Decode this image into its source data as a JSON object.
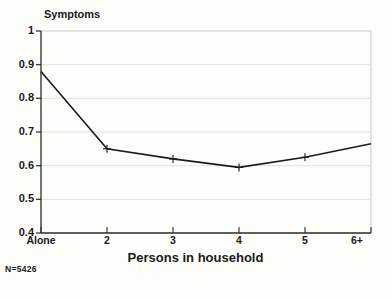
{
  "chart_data": {
    "type": "line",
    "title": "",
    "ylabel": "Symptoms",
    "xlabel": "Persons in household",
    "categories": [
      "Alone",
      "2",
      "3",
      "4",
      "5",
      "6+"
    ],
    "values": [
      0.88,
      0.65,
      0.62,
      0.595,
      0.625,
      0.665
    ],
    "series": [
      {
        "name": "Symptoms",
        "values": [
          0.88,
          0.65,
          0.62,
          0.595,
          0.625,
          0.665
        ]
      }
    ],
    "ylim": [
      0.4,
      1
    ],
    "ytick_labels": [
      "1",
      "0.9",
      "0.8",
      "0.7",
      "0.6",
      "0.5",
      "0.4"
    ],
    "ytick_values": [
      1,
      0.9,
      0.8,
      0.7,
      0.6,
      0.5,
      0.4
    ],
    "grid": true,
    "legend": "none",
    "marker": "plus",
    "line_color": "#1a1a1a",
    "grid_color": "#d8d8d2",
    "axis_color": "#3a3a3a",
    "annotation": "N=5426"
  },
  "axis": {
    "y_title": "Symptoms",
    "x_title": "Persons in household"
  },
  "footnote": {
    "sample_size": "N=5426"
  }
}
